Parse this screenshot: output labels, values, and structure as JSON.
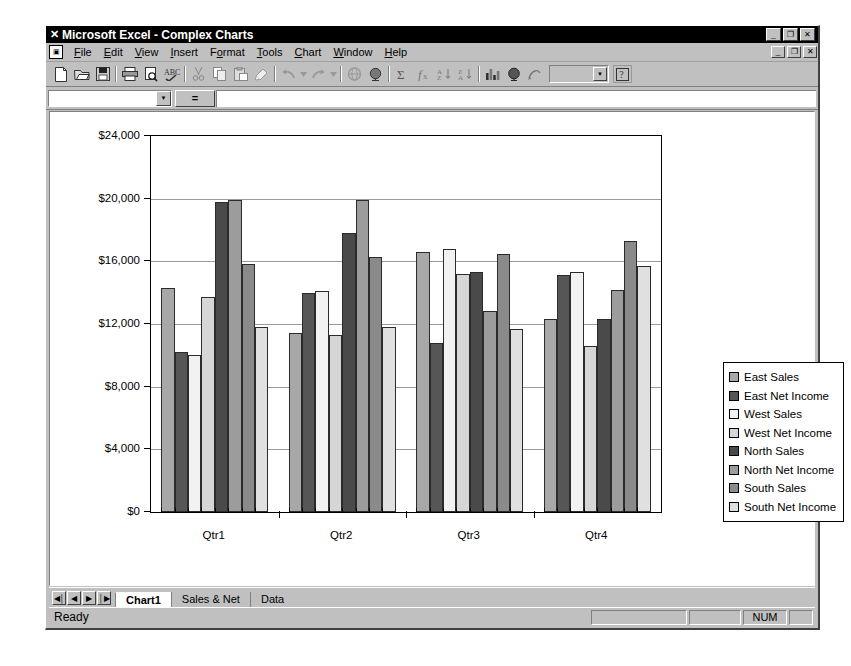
{
  "window": {
    "app_icon": "excel-x-icon",
    "title": "Microsoft Excel - Complex Charts",
    "minimize_label": "_",
    "restore_label": "❐",
    "close_label": "✕"
  },
  "menu": {
    "items": [
      {
        "label": "File",
        "accel": "F"
      },
      {
        "label": "Edit",
        "accel": "E"
      },
      {
        "label": "View",
        "accel": "V"
      },
      {
        "label": "Insert",
        "accel": "I"
      },
      {
        "label": "Format",
        "accel": "o"
      },
      {
        "label": "Tools",
        "accel": "T"
      },
      {
        "label": "Chart",
        "accel": "C"
      },
      {
        "label": "Window",
        "accel": "W"
      },
      {
        "label": "Help",
        "accel": "H"
      }
    ],
    "doc_minimize_label": "_",
    "doc_restore_label": "❐",
    "doc_close_label": "✕"
  },
  "toolbar": {
    "buttons": [
      {
        "name": "new-icon"
      },
      {
        "name": "open-icon"
      },
      {
        "name": "save-icon"
      },
      {
        "sep": true
      },
      {
        "name": "print-icon"
      },
      {
        "name": "print-preview-icon"
      },
      {
        "name": "spelling-icon"
      },
      {
        "sep": true
      },
      {
        "name": "cut-icon"
      },
      {
        "name": "copy-icon"
      },
      {
        "name": "paste-icon"
      },
      {
        "name": "format-painter-icon"
      },
      {
        "sep": true
      },
      {
        "name": "undo-icon"
      },
      {
        "name": "undo-dropdown-icon"
      },
      {
        "name": "redo-icon"
      },
      {
        "name": "redo-dropdown-icon"
      },
      {
        "sep": true
      },
      {
        "name": "insert-hyperlink-icon"
      },
      {
        "name": "web-toolbar-icon"
      },
      {
        "sep": true
      },
      {
        "name": "autosum-icon"
      },
      {
        "name": "paste-function-icon"
      },
      {
        "name": "sort-ascending-icon"
      },
      {
        "name": "sort-descending-icon"
      },
      {
        "sep": true
      },
      {
        "name": "chart-wizard-icon"
      },
      {
        "name": "map-icon"
      },
      {
        "name": "drawing-icon"
      }
    ],
    "zoom_value": "",
    "help_label": "?"
  },
  "formula_bar": {
    "name_box_value": "",
    "equals_label": "=",
    "formula_value": ""
  },
  "chart_data": {
    "type": "bar",
    "title": "",
    "xlabel": "",
    "ylabel": "",
    "ylim": [
      0,
      24000
    ],
    "ytick_labels": [
      "$24,000",
      "$20,000",
      "$16,000",
      "$12,000",
      "$8,000",
      "$4,000",
      "$0"
    ],
    "ytick_values": [
      24000,
      20000,
      16000,
      12000,
      8000,
      4000,
      0
    ],
    "grid": true,
    "legend_position": "right",
    "categories": [
      "Qtr1",
      "Qtr2",
      "Qtr3",
      "Qtr4"
    ],
    "series": [
      {
        "name": "East Sales",
        "color": "#a8a8a8",
        "values": [
          14300,
          11400,
          16600,
          12300
        ]
      },
      {
        "name": "East Net Income",
        "color": "#565656",
        "values": [
          10200,
          14000,
          10800,
          15100
        ]
      },
      {
        "name": "West Sales",
        "color": "#f2f2f2",
        "values": [
          10050,
          14100,
          16800,
          15300
        ]
      },
      {
        "name": "West Net Income",
        "color": "#d6d6d6",
        "values": [
          13700,
          11300,
          15200,
          10600
        ]
      },
      {
        "name": "North Sales",
        "color": "#4a4a4a",
        "values": [
          19800,
          17800,
          15300,
          12300
        ]
      },
      {
        "name": "North Net Income",
        "color": "#9c9c9c",
        "values": [
          19900,
          19900,
          12800,
          14200
        ]
      },
      {
        "name": "South Sales",
        "color": "#8a8a8a",
        "values": [
          15800,
          16300,
          16500,
          17300
        ]
      },
      {
        "name": "South Net Income",
        "color": "#e0e0e0",
        "values": [
          11800,
          11800,
          11700,
          15700
        ]
      }
    ]
  },
  "sheet_tabs": {
    "nav_first": "◀│",
    "nav_prev": "◀",
    "nav_next": "▶",
    "nav_last": "│▶",
    "tabs": [
      {
        "label": "Chart1",
        "active": true
      },
      {
        "label": "Sales & Net",
        "active": false
      },
      {
        "label": "Data",
        "active": false
      }
    ]
  },
  "status_bar": {
    "message": "Ready",
    "indicator_blank_1": "",
    "indicator_blank_2": "",
    "num_indicator": "NUM",
    "indicator_blank_3": ""
  }
}
